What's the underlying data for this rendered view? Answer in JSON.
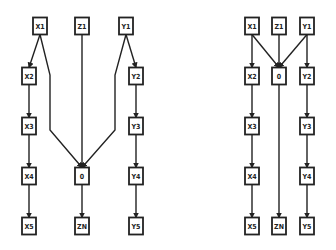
{
  "diagrams": [
    {
      "name": "left-diagram",
      "nodes": [
        {
          "id": "X1",
          "label": "X1",
          "x": 40,
          "y": 26
        },
        {
          "id": "Z1",
          "label": "Z1",
          "x": 82,
          "y": 26
        },
        {
          "id": "Y1",
          "label": "Y1",
          "x": 126,
          "y": 26
        },
        {
          "id": "X2",
          "label": "X2",
          "x": 29,
          "y": 76
        },
        {
          "id": "Y2",
          "label": "Y2",
          "x": 136,
          "y": 76
        },
        {
          "id": "X3",
          "label": "X3",
          "x": 29,
          "y": 126
        },
        {
          "id": "Y3",
          "label": "Y3",
          "x": 136,
          "y": 126
        },
        {
          "id": "X4",
          "label": "X4",
          "x": 29,
          "y": 176
        },
        {
          "id": "O",
          "label": "0",
          "x": 82,
          "y": 176
        },
        {
          "id": "Y4",
          "label": "Y4",
          "x": 136,
          "y": 176
        },
        {
          "id": "X5",
          "label": "X5",
          "x": 29,
          "y": 226
        },
        {
          "id": "ZN",
          "label": "ZN",
          "x": 82,
          "y": 226
        },
        {
          "id": "Y5",
          "label": "Y5",
          "x": 136,
          "y": 226
        }
      ],
      "edges": [
        {
          "from": "X1",
          "to": "X2"
        },
        {
          "from": "X2",
          "to": "X3"
        },
        {
          "from": "X3",
          "to": "X4"
        },
        {
          "from": "X4",
          "to": "X5"
        },
        {
          "from": "Y1",
          "to": "Y2"
        },
        {
          "from": "Y2",
          "to": "Y3"
        },
        {
          "from": "Y3",
          "to": "Y4"
        },
        {
          "from": "Y4",
          "to": "Y5"
        },
        {
          "from": "X1",
          "to": "O",
          "via": [
            [
              50,
              75
            ],
            [
              50,
              130
            ]
          ]
        },
        {
          "from": "Y1",
          "to": "O",
          "via": [
            [
              115,
              75
            ],
            [
              115,
              130
            ]
          ]
        },
        {
          "from": "Z1",
          "to": "O"
        },
        {
          "from": "O",
          "to": "ZN"
        }
      ]
    },
    {
      "name": "right-diagram",
      "nodes": [
        {
          "id": "X1",
          "label": "X1",
          "x": 252,
          "y": 26
        },
        {
          "id": "Z1",
          "label": "Z1",
          "x": 279,
          "y": 26
        },
        {
          "id": "Y1",
          "label": "Y1",
          "x": 307,
          "y": 26
        },
        {
          "id": "X2",
          "label": "X2",
          "x": 252,
          "y": 76
        },
        {
          "id": "O",
          "label": "0",
          "x": 279,
          "y": 76
        },
        {
          "id": "Y2",
          "label": "Y2",
          "x": 307,
          "y": 76
        },
        {
          "id": "X3",
          "label": "X3",
          "x": 252,
          "y": 126
        },
        {
          "id": "Y3",
          "label": "Y3",
          "x": 307,
          "y": 126
        },
        {
          "id": "X4",
          "label": "X4",
          "x": 252,
          "y": 176
        },
        {
          "id": "Y4",
          "label": "Y4",
          "x": 307,
          "y": 176
        },
        {
          "id": "X5",
          "label": "X5",
          "x": 252,
          "y": 226
        },
        {
          "id": "ZN",
          "label": "ZN",
          "x": 279,
          "y": 226
        },
        {
          "id": "Y5",
          "label": "Y5",
          "x": 307,
          "y": 226
        }
      ],
      "edges": [
        {
          "from": "X1",
          "to": "X2"
        },
        {
          "from": "X2",
          "to": "X3"
        },
        {
          "from": "X3",
          "to": "X4"
        },
        {
          "from": "X4",
          "to": "X5"
        },
        {
          "from": "Y1",
          "to": "Y2"
        },
        {
          "from": "Y2",
          "to": "Y3"
        },
        {
          "from": "Y3",
          "to": "Y4"
        },
        {
          "from": "Y4",
          "to": "Y5"
        },
        {
          "from": "X1",
          "to": "O"
        },
        {
          "from": "Y1",
          "to": "O"
        },
        {
          "from": "Z1",
          "to": "O"
        },
        {
          "from": "O",
          "to": "ZN"
        }
      ]
    }
  ],
  "style": {
    "stroke": "#222222",
    "background": "#ffffff",
    "box_w": 14,
    "box_h": 17
  }
}
